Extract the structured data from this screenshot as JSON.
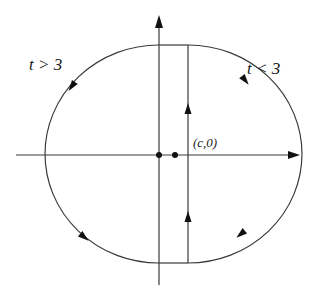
{
  "diagram": {
    "type": "phase-portrait",
    "labels": {
      "left_region": "t > 3",
      "right_region": "t < 3",
      "point": "(c,0)"
    },
    "colors": {
      "stroke": "#3a3a3a",
      "ink": "#111111",
      "background": "#ffffff"
    },
    "axes": {
      "horizontal": {
        "y": 155,
        "x_start": 16,
        "x_end": 300
      },
      "vertical": {
        "x": 159,
        "y_start": 285,
        "y_end": 15
      }
    },
    "curve": {
      "center": [
        159,
        154
      ],
      "rx": 114,
      "ry": 109,
      "cut_line_x": 188,
      "top_y": 45,
      "bottom_y": 263
    },
    "points": [
      {
        "name": "origin",
        "x": 159,
        "y": 155
      },
      {
        "name": "c",
        "x": 175,
        "y": 155
      }
    ],
    "direction_arrows": [
      {
        "where": "upper-left arc",
        "direction": "down-left"
      },
      {
        "where": "lower-left arc",
        "direction": "down-right"
      },
      {
        "where": "upper-right arc",
        "direction": "down-right"
      },
      {
        "where": "lower-right arc",
        "direction": "down-left"
      },
      {
        "where": "vertical segment upper",
        "direction": "up"
      },
      {
        "where": "vertical segment lower",
        "direction": "up"
      }
    ]
  }
}
